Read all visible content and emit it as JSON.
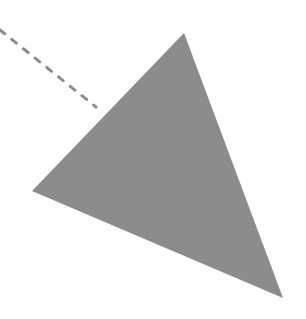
{
  "canvas": {
    "width": 306,
    "height": 319,
    "background": "#ffffff"
  },
  "shapes": {
    "triangle": {
      "points": [
        [
          184,
          33
        ],
        [
          32,
          191
        ],
        [
          283,
          298
        ]
      ],
      "fill": "#8c8c8c"
    },
    "dashed_line": {
      "x1": 0,
      "y1": 30,
      "x2": 96,
      "y2": 107,
      "stroke": "#8c8c8c",
      "stroke_width": 3,
      "dasharray": "6 9"
    }
  }
}
